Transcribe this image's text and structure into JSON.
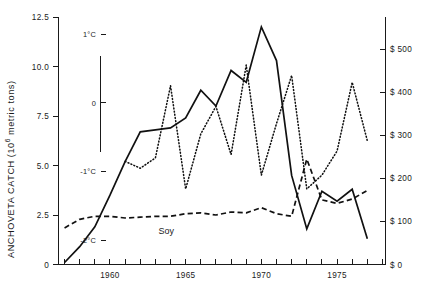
{
  "figure": {
    "width": 427,
    "height": 290,
    "background": "#ffffff",
    "ink_color": "#111111"
  },
  "axes": {
    "left": {
      "title": "ANCHOVETA CATCH (10",
      "title_sup": "6",
      "title_tail": " metric tons)",
      "ticks": [
        "0",
        "2.5",
        "5.0",
        "7.5",
        "10.0",
        "12.5"
      ],
      "values": [
        0,
        2.5,
        5.0,
        7.5,
        10.0,
        12.5
      ],
      "range": [
        0,
        12.5
      ]
    },
    "inner_temperature": {
      "ticks": [
        "-2°C",
        "-1°C",
        "0",
        "1°C"
      ],
      "values": [
        -2,
        -1,
        0,
        1
      ],
      "range": [
        -2.35,
        1.25
      ]
    },
    "right": {
      "ticks": [
        "$ 500",
        "$ 400",
        "$ 300",
        "$ 200",
        "$ 100",
        "$ 0"
      ],
      "values": [
        500,
        400,
        300,
        200,
        100,
        0
      ],
      "range": [
        0,
        575
      ]
    },
    "bottom": {
      "labels": [
        "1960",
        "1965",
        "1970",
        "1975"
      ],
      "label_values": [
        1960,
        1965,
        1970,
        1975
      ],
      "range": [
        1956.6,
        1978.2
      ],
      "tick_step": 1
    }
  },
  "series_labels": {
    "soy": "Soy"
  },
  "chart_data": {
    "type": "line",
    "title": "",
    "xlabel": "",
    "ylabel": "ANCHOVETA CATCH (10^6 metric tons)",
    "y2label": "$",
    "xlim": [
      1956.6,
      1978.2
    ],
    "ylim": [
      0,
      12.5
    ],
    "y2lim": [
      0,
      575
    ],
    "grid": false,
    "legend": "none",
    "x": [
      1957,
      1958,
      1959,
      1960,
      1961,
      1962,
      1963,
      1964,
      1965,
      1966,
      1967,
      1968,
      1969,
      1970,
      1971,
      1972,
      1973,
      1974,
      1975,
      1976,
      1977
    ],
    "series": [
      {
        "name": "Anchoveta catch",
        "style": "solid",
        "axis": "left",
        "unit": "10^6 metric tons",
        "values": [
          0.1,
          0.9,
          1.9,
          3.5,
          5.2,
          6.7,
          6.8,
          6.9,
          7.4,
          8.8,
          8.0,
          9.8,
          9.2,
          12.0,
          10.3,
          4.5,
          1.8,
          3.7,
          3.2,
          3.8,
          1.3
        ]
      },
      {
        "name": "Sea surface temperature anomaly",
        "style": "dotted",
        "axis": "inner_temperature",
        "unit": "°C",
        "values": [
          null,
          null,
          null,
          null,
          -0.85,
          -0.95,
          -0.8,
          0.25,
          -1.25,
          -0.45,
          -0.05,
          -0.75,
          0.55,
          -1.05,
          -0.3,
          0.4,
          -1.25,
          -1.05,
          -0.7,
          0.3,
          -0.55
        ]
      },
      {
        "name": "Soy price",
        "style": "dashed",
        "axis": "right",
        "unit": "$",
        "values": [
          85,
          105,
          112,
          112,
          108,
          110,
          112,
          112,
          118,
          120,
          115,
          122,
          120,
          132,
          118,
          112,
          245,
          150,
          142,
          152,
          172
        ]
      }
    ],
    "annotations": [
      {
        "text": "Soy",
        "x": 1963.2,
        "y_axis": "right",
        "y": 70
      }
    ]
  }
}
